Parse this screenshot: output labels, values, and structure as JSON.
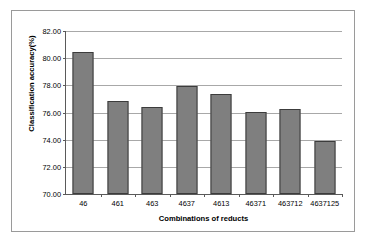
{
  "chart_data": {
    "type": "bar",
    "title": "",
    "xlabel": "Combinations of reducts",
    "ylabel": "Classification accuracy(%)",
    "categories": [
      "46",
      "461",
      "463",
      "4637",
      "4613",
      "46371",
      "463712",
      "4637125"
    ],
    "values": [
      80.46,
      76.85,
      76.42,
      77.96,
      77.35,
      76.02,
      76.27,
      73.92
    ],
    "ylim": [
      70.0,
      82.0
    ],
    "ytick_labels": [
      "82.00",
      "80.00",
      "78.00",
      "76.00",
      "74.00",
      "72.00",
      "70.00"
    ],
    "ytick_values": [
      82.0,
      80.0,
      78.0,
      76.0,
      74.0,
      72.0,
      70.0
    ],
    "grid": true,
    "legend": "none",
    "bar_color": "#7f7f7f",
    "bar_border_color": "#3c3c3c",
    "grid_color": "#a8a8a8",
    "axis_color": "#5a5a5a",
    "frame_color": "#9a9a9a",
    "background": "#ffffff"
  }
}
